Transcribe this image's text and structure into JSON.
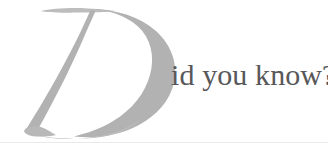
{
  "banner": {
    "dropcap_letter": "D",
    "headline_text": "id you know?",
    "full_phrase": "Did you know?",
    "colors": {
      "background": "#ffffff",
      "dropcap_gray": "#b3b3b3",
      "dropcap_gray_light": "#c4c4c4",
      "headline_gray": "#58585a",
      "rule_gray": "#e9e9e9"
    },
    "dropcap_style": "italic-swash-serif",
    "headline_style": "serif"
  }
}
